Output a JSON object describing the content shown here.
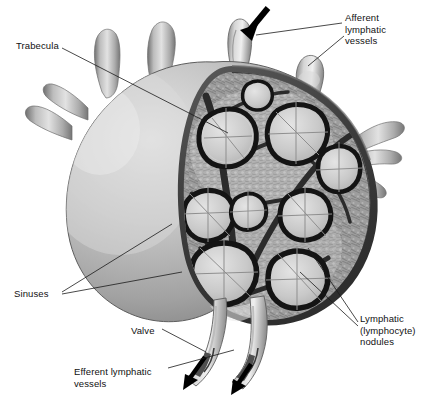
{
  "figure": {
    "style": "grayscale anatomical illustration",
    "width": 428,
    "height": 402
  },
  "colors": {
    "background": "#ffffff",
    "label_text": "#111111",
    "leader_line": "#1a1a1a",
    "capsule_outer_light": "#d8d8d8",
    "capsule_outer_mid": "#a9a9a9",
    "capsule_outer_dark": "#7c7c7c",
    "capsule_band": "#4a4a4a",
    "capsule_band_dark": "#343434",
    "medulla_stipple": "#8e8e8e",
    "cortex_light": "#c9c9c9",
    "nodule_fill": "#cfcfcf",
    "nodule_outline": "#161616",
    "trabecula": "#3a3a3a",
    "vessel_light": "#dcdcdc",
    "vessel_mid": "#a0a0a0",
    "vessel_shadow": "#6e6e6e",
    "arrow": "#000000"
  },
  "labels": [
    {
      "id": "trabecula",
      "name": "Trabecula",
      "text": "Trabecula",
      "x": 16,
      "y": 40,
      "align": "left",
      "lines": 1
    },
    {
      "id": "afferent",
      "name": "Afferent lymphatic vessels",
      "text": "Afferent\nlymphatic\nvessels",
      "x": 345,
      "y": 12,
      "align": "left",
      "lines": 3
    },
    {
      "id": "nodules",
      "name": "Lymphatic (lymphocyte) nodules",
      "text": "Lymphatic\n(lymphocyte)\nnodules",
      "x": 360,
      "y": 313,
      "align": "left",
      "lines": 3
    },
    {
      "id": "sinuses",
      "name": "Sinuses",
      "text": "Sinuses",
      "x": 14,
      "y": 288,
      "align": "left",
      "lines": 1
    },
    {
      "id": "valve",
      "name": "Valve",
      "text": "Valve",
      "x": 131,
      "y": 325,
      "align": "left",
      "lines": 1
    },
    {
      "id": "efferent",
      "name": "Efferent lymphatic vessels",
      "text": "Efferent lymphatic\nvessels",
      "x": 74,
      "y": 366,
      "align": "left",
      "lines": 2
    }
  ],
  "flow_arrows": [
    {
      "id": "afferent-inflow",
      "direction": "into-node",
      "x": 252,
      "y": 22
    },
    {
      "id": "efferent-outflow-left",
      "direction": "out-of-node",
      "x": 196,
      "y": 370
    },
    {
      "id": "efferent-outflow-right",
      "direction": "out-of-node",
      "x": 243,
      "y": 378
    }
  ]
}
